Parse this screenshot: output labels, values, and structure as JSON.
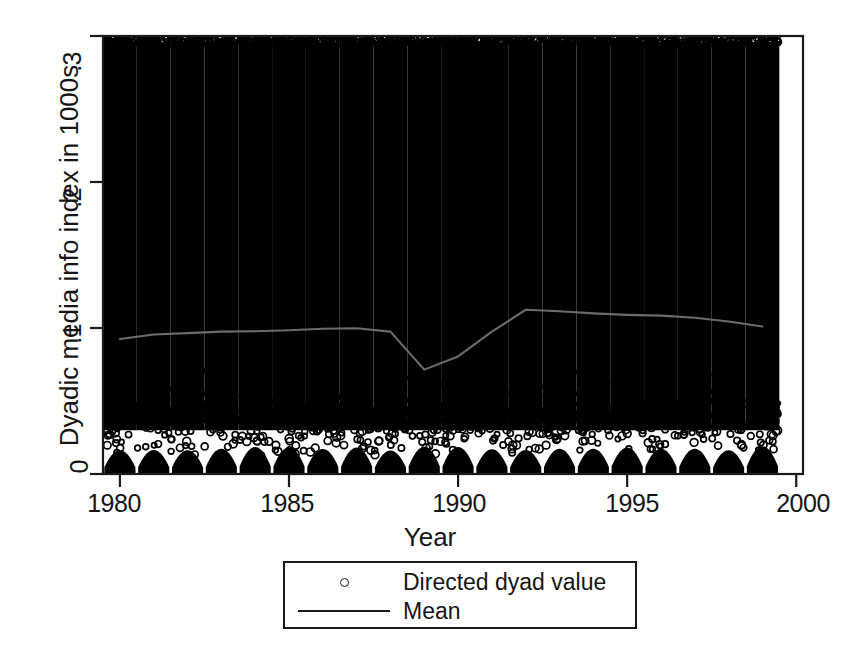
{
  "chart_data": {
    "type": "scatter",
    "title": "",
    "subtitle": "",
    "xlabel": "Year",
    "ylabel": "Dyadic media info index in 1000s",
    "xlim": [
      1979.5,
      2000.2
    ],
    "ylim": [
      0,
      0.3
    ],
    "xticks": [
      1980,
      1985,
      1990,
      1995,
      2000
    ],
    "xticklabels": [
      "1980",
      "1985",
      "1990",
      "1995",
      "2000"
    ],
    "yticks": [
      0,
      0.1,
      0.2,
      0.3
    ],
    "yticklabels": [
      "0",
      ".1",
      ".2",
      ".3"
    ],
    "grid": false,
    "legend_position": "below-plot",
    "series": [
      {
        "name": "Directed dyad value",
        "type": "scatter",
        "marker": "open-circle",
        "color": "#000000",
        "description": "Very dense cloud of directed-dyad observations, one column per year from 1980 to 1999, values spanning 0 to about 0.30; saturated solid black from roughly 0.035 upward, sparse open circles in a band between about 0.012 and 0.035, and a solid scalloped mass near 0.",
        "x_range": [
          1980,
          1999
        ],
        "y_range": [
          0,
          0.3
        ],
        "density_top": 0.297,
        "density_gap_band": [
          0.012,
          0.034
        ],
        "n_points_approx": 60000
      },
      {
        "name": "Mean",
        "type": "line",
        "color": "#6b6b6b",
        "x": [
          1980,
          1981,
          1982,
          1983,
          1984,
          1985,
          1986,
          1987,
          1988,
          1989,
          1990,
          1991,
          1992,
          1993,
          1994,
          1995,
          1996,
          1997,
          1998,
          1999
        ],
        "values": [
          0.0925,
          0.0955,
          0.0965,
          0.0975,
          0.0978,
          0.0985,
          0.0995,
          0.0998,
          0.0975,
          0.0715,
          0.0805,
          0.0975,
          0.1125,
          0.1115,
          0.11,
          0.109,
          0.1085,
          0.107,
          0.1045,
          0.101
        ]
      }
    ],
    "annotations": []
  },
  "axes": {
    "x_title": "Year",
    "y_title": "Dyadic media info index in 1000s",
    "x_tick_labels": [
      "1980",
      "1985",
      "1990",
      "1995",
      "2000"
    ],
    "y_tick_labels": [
      "0",
      ".1",
      ".2",
      ".3"
    ]
  },
  "legend": {
    "entries": [
      {
        "key": "open-circle-marker",
        "label": "Directed dyad value"
      },
      {
        "key": "solid-line",
        "label": "Mean"
      }
    ]
  },
  "colors": {
    "foreground": "#111111",
    "background": "#ffffff",
    "frame": "#1a1a1a",
    "scatter": "#000000",
    "mean_line": "#6b6b6b"
  }
}
